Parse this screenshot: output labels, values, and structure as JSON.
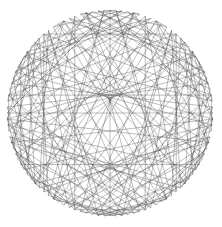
{
  "figure": {
    "kind": "geometric-line-art",
    "canvas": {
      "width": 222,
      "height": 227,
      "background": "#ffffff"
    },
    "circle": {
      "center_x": 110,
      "center_y": 113,
      "outer_radius": 103,
      "inner_envelope_radius": 31
    },
    "construction": {
      "point_count": 108,
      "step_multiplier": 43,
      "description": "108 points equally spaced on a circle; point i joined by a straight chord to point (i*43) mod 108"
    },
    "stroke": {
      "color": "#3a3a3a",
      "width": 0.42,
      "opacity": 0.78
    },
    "labels": {
      "caption": ""
    }
  },
  "chart_data": {
    "type": "scatter",
    "title": "",
    "xlabel": "",
    "ylabel": "",
    "xlim": [
      0,
      222
    ],
    "ylim": [
      0,
      227
    ],
    "grid": false,
    "legend": "none",
    "series": [
      {
        "name": "chords",
        "point_count": 108,
        "step": 43,
        "center": [
          110,
          113
        ],
        "radius": 103,
        "envelope_radius": 31
      }
    ],
    "annotations": []
  }
}
